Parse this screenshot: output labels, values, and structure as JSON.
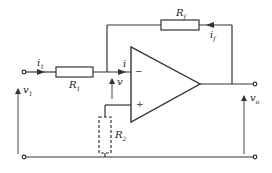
{
  "diagram": {
    "labels": {
      "i1": {
        "main": "i",
        "sub": "1"
      },
      "R1": {
        "main": "R",
        "sub": "1"
      },
      "i": {
        "main": "i",
        "sub": ""
      },
      "v": {
        "main": "v",
        "sub": ""
      },
      "Rf": {
        "main": "R",
        "sub": "f"
      },
      "if": {
        "main": "i",
        "sub": "f"
      },
      "R2": {
        "main": "R",
        "sub": "2"
      },
      "v1": {
        "main": "v",
        "sub": "1"
      },
      "vo": {
        "main": "v",
        "sub": "o"
      },
      "minus": "−",
      "plus": "+"
    },
    "components": [
      {
        "id": "R1",
        "type": "resistor",
        "style": "solid"
      },
      {
        "id": "Rf",
        "type": "resistor",
        "style": "solid"
      },
      {
        "id": "R2",
        "type": "resistor",
        "style": "dashed"
      },
      {
        "id": "opamp",
        "type": "operational-amplifier"
      }
    ],
    "colors": {
      "line": "#333333",
      "background": "#ffffff"
    }
  }
}
